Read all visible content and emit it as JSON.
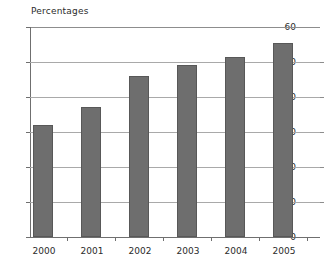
{
  "chart_data": {
    "type": "bar",
    "title": "Percentages",
    "xlabel": "",
    "ylabel": "",
    "categories": [
      "2000",
      "2001",
      "2002",
      "2003",
      "2004",
      "2005"
    ],
    "values": [
      32.1,
      37.2,
      46.1,
      49.2,
      51.4,
      55.4
    ],
    "ylim": [
      0,
      60
    ],
    "yticks": [
      "0",
      "10",
      "20",
      "30",
      "40",
      "50",
      "60"
    ],
    "ytick_values": [
      0,
      10,
      20,
      30,
      40,
      50,
      60
    ],
    "grid": true,
    "legend": null,
    "series": [
      {
        "name": "Percentages",
        "values": [
          32.1,
          37.2,
          46.1,
          49.2,
          51.4,
          55.4
        ]
      }
    ],
    "colors": {
      "bar_fill": "#6e6e6e",
      "bar_border": "#585858",
      "gridline": "#a9a9a9",
      "axis": "#6f6f6f",
      "text": "#2b2b2b",
      "background": "#ffffff"
    }
  }
}
